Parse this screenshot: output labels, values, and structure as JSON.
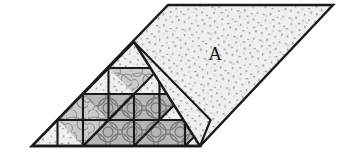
{
  "figure": {
    "type": "geometric-diagram",
    "background_color": "#ffffff",
    "outline_color": "#1a1a1a",
    "outline_width": 2.2,
    "labels": [
      {
        "text": "A",
        "x": 215,
        "y": 56,
        "region": "upper-right-speckled-parallelogram"
      }
    ],
    "colors": {
      "speckle_light": "#ededed",
      "speckle_light_dot": "#9a9a9a",
      "hatch_mid": "#c9c9c9",
      "hatch_mid_line": "#8e8e8e",
      "circle_dark": "#b4b4b4",
      "circle_dark_line": "#7a7a7a",
      "outline": "#1a1a1a",
      "label": "#1a1a1a"
    },
    "outer_shape": {
      "name": "parallelogram",
      "vertices": [
        {
          "x": 32,
          "y": 146
        },
        {
          "x": 168,
          "y": 5
        },
        {
          "x": 333,
          "y": 5
        },
        {
          "x": 200,
          "y": 146
        }
      ]
    },
    "inner_triangle": {
      "name": "large-subdivided-triangle",
      "vertices": [
        {
          "x": 32,
          "y": 146
        },
        {
          "x": 134,
          "y": 42
        },
        {
          "x": 200,
          "y": 146
        }
      ],
      "subdivision_rows": 4
    },
    "region_a": {
      "name": "region-A",
      "label": "A",
      "fill": "speckle_light",
      "vertices": [
        {
          "x": 134,
          "y": 42
        },
        {
          "x": 168,
          "y": 5
        },
        {
          "x": 333,
          "y": 5
        },
        {
          "x": 200,
          "y": 146
        }
      ]
    },
    "cell_fills": {
      "r0": [
        "speckle_light"
      ],
      "r1": [
        "speckle_light",
        "hatch_mid",
        "speckle_light"
      ],
      "r2": [
        "hatch_mid",
        "circle_dark",
        "circle_dark",
        "circle_dark",
        "speckle_light"
      ],
      "r3": [
        "speckle_light",
        "hatch_mid",
        "circle_dark",
        "circle_dark",
        "circle_dark",
        "circle_dark",
        "speckle_light"
      ]
    }
  }
}
